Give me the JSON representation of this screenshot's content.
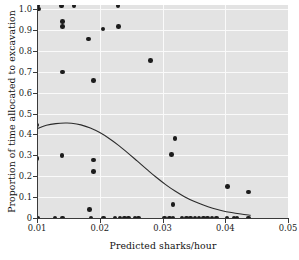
{
  "chart_data": {
    "type": "scatter",
    "title": "",
    "xlabel": "Predicted sharks/hour",
    "ylabel": "Proportion of time allocated to excavation",
    "xlim": [
      0.01,
      0.05
    ],
    "ylim": [
      0.0,
      1.02
    ],
    "xticks": [
      0.01,
      0.02,
      0.03,
      0.04,
      0.05
    ],
    "xticklabels": [
      "0.01",
      "0.02",
      "0.03",
      "0.04",
      "0.05"
    ],
    "yticks": [
      0.0,
      0.1,
      0.2,
      0.3,
      0.4,
      0.5,
      0.6,
      0.7,
      0.8,
      0.9,
      1.0
    ],
    "yticklabels": [
      "0",
      "0.1",
      "0.2",
      "0.3",
      "0.4",
      "0.5",
      "0.6",
      "0.7",
      "0.8",
      "0.9",
      "1.0"
    ],
    "grid": true,
    "grid_color": "#fafafa",
    "panel_background": "#e3e3e3",
    "legend": null,
    "marker_color": "#1c1c1c",
    "marker_size": 4.6,
    "points": [
      {
        "x": 0.0101,
        "y": 1.015
      },
      {
        "x": 0.0102,
        "y": 1.0
      },
      {
        "x": 0.01,
        "y": 0.445
      },
      {
        "x": 0.01,
        "y": 0.285
      },
      {
        "x": 0.0101,
        "y": 0.0
      },
      {
        "x": 0.0139,
        "y": 1.015
      },
      {
        "x": 0.0141,
        "y": 0.94
      },
      {
        "x": 0.0141,
        "y": 0.918
      },
      {
        "x": 0.0141,
        "y": 0.7
      },
      {
        "x": 0.014,
        "y": 0.3
      },
      {
        "x": 0.0129,
        "y": 0.0
      },
      {
        "x": 0.0141,
        "y": 0.0
      },
      {
        "x": 0.0159,
        "y": 1.015
      },
      {
        "x": 0.0182,
        "y": 0.858
      },
      {
        "x": 0.0184,
        "y": 0.042
      },
      {
        "x": 0.0186,
        "y": 0.0
      },
      {
        "x": 0.019,
        "y": 0.658
      },
      {
        "x": 0.019,
        "y": 0.278
      },
      {
        "x": 0.019,
        "y": 0.223
      },
      {
        "x": 0.0205,
        "y": 0.905
      },
      {
        "x": 0.0206,
        "y": 0.0
      },
      {
        "x": 0.0229,
        "y": 1.015
      },
      {
        "x": 0.023,
        "y": 0.918
      },
      {
        "x": 0.0224,
        "y": 0.0
      },
      {
        "x": 0.0232,
        "y": 0.0
      },
      {
        "x": 0.0239,
        "y": 0.0
      },
      {
        "x": 0.0246,
        "y": 0.0
      },
      {
        "x": 0.0256,
        "y": 0.0
      },
      {
        "x": 0.0262,
        "y": 0.0
      },
      {
        "x": 0.0281,
        "y": 0.755
      },
      {
        "x": 0.0303,
        "y": 0.0
      },
      {
        "x": 0.0311,
        "y": 0.0
      },
      {
        "x": 0.0317,
        "y": 0.0
      },
      {
        "x": 0.0314,
        "y": 0.305
      },
      {
        "x": 0.032,
        "y": 0.382
      },
      {
        "x": 0.0317,
        "y": 0.065
      },
      {
        "x": 0.0331,
        "y": 0.0
      },
      {
        "x": 0.0338,
        "y": 0.0
      },
      {
        "x": 0.0345,
        "y": 0.0
      },
      {
        "x": 0.0352,
        "y": 0.0
      },
      {
        "x": 0.0358,
        "y": 0.0
      },
      {
        "x": 0.0365,
        "y": 0.0
      },
      {
        "x": 0.0372,
        "y": 0.0
      },
      {
        "x": 0.0379,
        "y": 0.0
      },
      {
        "x": 0.0386,
        "y": 0.0
      },
      {
        "x": 0.0404,
        "y": 0.152
      },
      {
        "x": 0.0403,
        "y": 0.0
      },
      {
        "x": 0.0414,
        "y": 0.0
      },
      {
        "x": 0.0419,
        "y": 0.0
      },
      {
        "x": 0.0437,
        "y": 0.125
      },
      {
        "x": 0.0437,
        "y": 0.0
      }
    ],
    "fit_curve": {
      "name": "fitted regression line",
      "color": "#2b2b2b",
      "width": 1.1,
      "x": [
        0.01,
        0.0115,
        0.013,
        0.0145,
        0.0155,
        0.017,
        0.0185,
        0.02,
        0.0215,
        0.023,
        0.0245,
        0.026,
        0.0275,
        0.029,
        0.0305,
        0.032,
        0.0335,
        0.035,
        0.0365,
        0.038,
        0.0395,
        0.041,
        0.0425,
        0.044
      ],
      "y": [
        0.428,
        0.444,
        0.452,
        0.455,
        0.454,
        0.446,
        0.431,
        0.409,
        0.381,
        0.348,
        0.311,
        0.272,
        0.233,
        0.195,
        0.16,
        0.129,
        0.102,
        0.08,
        0.062,
        0.047,
        0.035,
        0.026,
        0.019,
        0.013
      ]
    }
  },
  "axis_titles": {
    "x": "Predicted sharks/hour",
    "y": "Proportion of time allocated to excavation"
  }
}
